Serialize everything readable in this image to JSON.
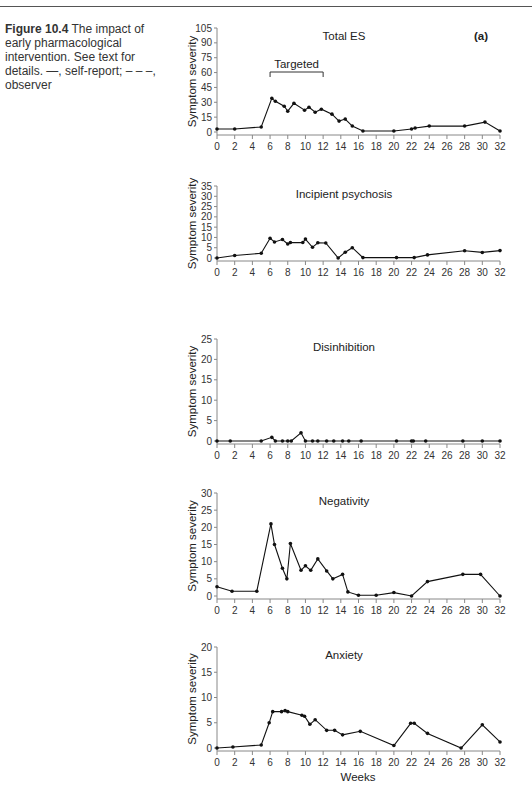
{
  "caption": {
    "figure_label": "Figure 10.4",
    "text": "The impact of early pharmacological intervention. See text for details. —, self-report; – – –, observer"
  },
  "panel_label": "(a)",
  "x_axis": {
    "label": "Weeks",
    "ticks": [
      "0",
      "2",
      "4",
      "6",
      "8",
      "10",
      "12",
      "14",
      "16",
      "18",
      "20",
      "22",
      "24",
      "26",
      "28",
      "30",
      "32"
    ],
    "range": [
      0,
      32
    ]
  },
  "chart_data": [
    {
      "type": "line",
      "title": "Total ES",
      "xlabel": "",
      "ylabel": "Symptom severity",
      "ylim": [
        0,
        105
      ],
      "yticks": [
        0,
        15,
        30,
        45,
        60,
        75,
        90,
        105
      ],
      "annotation": {
        "text": "Targeted",
        "x_start": 6,
        "x_end": 12
      },
      "series": [
        {
          "name": "self-report",
          "x": [
            0,
            2,
            5,
            6.2,
            6.6,
            7.6,
            8,
            8.7,
            9.9,
            10.4,
            11.1,
            11.8,
            13,
            13.8,
            14.5,
            15.3,
            16.5,
            20,
            22,
            22.4,
            24,
            28,
            30.3,
            32
          ],
          "y": [
            3,
            3,
            5,
            34,
            31,
            26,
            21,
            29,
            22,
            25,
            20,
            23,
            18,
            11,
            13,
            6,
            1,
            1,
            3,
            4,
            6,
            6,
            10,
            1
          ]
        }
      ]
    },
    {
      "type": "line",
      "title": "Incipient psychosis",
      "xlabel": "",
      "ylabel": "Symptom severity",
      "ylim": [
        0,
        35
      ],
      "yticks": [
        0,
        5,
        10,
        15,
        20,
        25,
        30,
        35
      ],
      "series": [
        {
          "name": "self-report",
          "x": [
            0,
            2,
            5,
            6,
            6.5,
            7.4,
            8,
            8.3,
            9.7,
            10,
            10.8,
            11.4,
            12.3,
            13.7,
            14.5,
            15.3,
            16.5,
            20.3,
            22.3,
            23.8,
            28,
            30,
            32
          ],
          "y": [
            0,
            1.2,
            2.3,
            9.6,
            7.8,
            9,
            6.8,
            7.5,
            7.5,
            9.2,
            5.2,
            7.4,
            7.3,
            0,
            2.8,
            5,
            0.2,
            0.2,
            0.2,
            1.5,
            3.5,
            2.7,
            3.6
          ]
        }
      ]
    },
    {
      "type": "line",
      "title": "Disinhibition",
      "xlabel": "",
      "ylabel": "Symptom severity",
      "ylim": [
        0,
        25
      ],
      "yticks": [
        0,
        5,
        10,
        15,
        20,
        25
      ],
      "series": [
        {
          "name": "self-report",
          "x": [
            0,
            1.5,
            5,
            6.2,
            6.6,
            7.4,
            8,
            8.4,
            9.5,
            10,
            10.8,
            11.4,
            12.4,
            13.2,
            14.2,
            14.9,
            16.3,
            20.3,
            22,
            22.2,
            23.6,
            27.8,
            30,
            32
          ],
          "y": [
            0,
            0,
            0,
            0.9,
            0,
            0,
            0,
            0,
            2,
            0,
            0,
            0,
            0,
            0,
            0,
            0,
            0,
            0,
            0,
            0,
            0,
            0,
            0,
            0
          ]
        }
      ]
    },
    {
      "type": "line",
      "title": "Negativity",
      "xlabel": "",
      "ylabel": "Symptom severity",
      "ylim": [
        0,
        30
      ],
      "yticks": [
        0,
        5,
        10,
        15,
        20,
        25,
        30
      ],
      "series": [
        {
          "name": "self-report",
          "x": [
            0,
            1.7,
            4.5,
            6.1,
            6.5,
            7.4,
            7.9,
            8.3,
            9.5,
            10,
            10.6,
            11.4,
            12.4,
            13.1,
            14.2,
            14.8,
            16,
            18,
            20,
            22,
            23.8,
            27.8,
            29.8,
            32
          ],
          "y": [
            2.7,
            1.4,
            1.4,
            21,
            15,
            8.1,
            5,
            15.3,
            7.5,
            8.8,
            7.5,
            10.8,
            7.3,
            5,
            6.3,
            1.2,
            0.2,
            0.2,
            1,
            0,
            4.2,
            6.3,
            6.3,
            0
          ]
        }
      ]
    },
    {
      "type": "line",
      "title": "Anxiety",
      "xlabel": "Weeks",
      "ylabel": "Symptom severity",
      "ylim": [
        0,
        20
      ],
      "yticks": [
        0,
        5,
        10,
        15,
        20
      ],
      "series": [
        {
          "name": "self-report",
          "x": [
            0,
            1.8,
            5,
            5.9,
            6.3,
            7.3,
            7.7,
            8,
            9.6,
            9.9,
            10.5,
            11.1,
            12.4,
            13.3,
            14.2,
            16.2,
            20,
            21.9,
            22.3,
            23.8,
            27.6,
            30,
            32
          ],
          "y": [
            0,
            0.2,
            0.6,
            5,
            7.2,
            7.2,
            7.4,
            7.2,
            6.5,
            6.3,
            4.7,
            5.6,
            3.5,
            3.5,
            2.6,
            3.3,
            0.5,
            4.9,
            4.9,
            2.9,
            0,
            4.6,
            1.2
          ]
        }
      ]
    }
  ]
}
